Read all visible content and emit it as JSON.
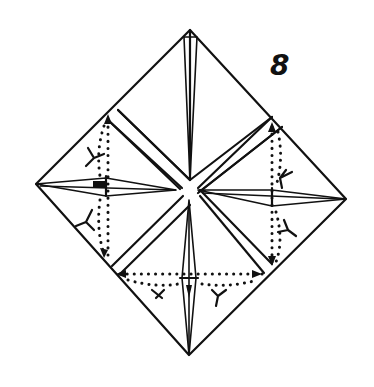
{
  "figure": {
    "type": "origami-fold-diagram",
    "step_number": "8",
    "colors": {
      "ink": "#111111",
      "paper": "#ffffff"
    },
    "elements": [
      "outer-square-diamond",
      "center-x-gap",
      "four-inner-triangular-flaps",
      "dotted-fold-lines",
      "valley-fold-arrows"
    ]
  }
}
